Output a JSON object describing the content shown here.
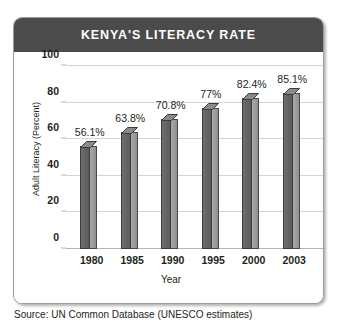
{
  "panel": {
    "title": "KENYA'S LITERACY RATE"
  },
  "source_note": "Source: UN Common Database (UNESCO estimates)",
  "colors": {
    "title_band": "#4b4b4b",
    "bar_front": "#636363",
    "bar_side": "#9a9a9a",
    "bar_top": "#8a8a8a",
    "gridline": "#d4d4d4",
    "text": "#231f20",
    "panel_border": "#9b9b9b"
  },
  "chart_data": {
    "type": "bar",
    "title": "KENYA'S LITERACY RATE",
    "xlabel": "Year",
    "ylabel": "Adult Literacy (Percent)",
    "categories": [
      "1980",
      "1985",
      "1990",
      "1995",
      "2000",
      "2003"
    ],
    "values": [
      56.1,
      63.8,
      70.8,
      77,
      82.4,
      85.1
    ],
    "value_labels": [
      "56.1%",
      "63.8%",
      "70.8%",
      "77%",
      "82.4%",
      "85.1%"
    ],
    "ylim": [
      0,
      100
    ],
    "yticks": [
      0,
      20,
      40,
      60,
      80,
      100
    ],
    "ytick_labels": [
      "0",
      "20",
      "40",
      "60",
      "80",
      "100"
    ],
    "grid": true,
    "legend": "none",
    "style": "3d-column"
  }
}
